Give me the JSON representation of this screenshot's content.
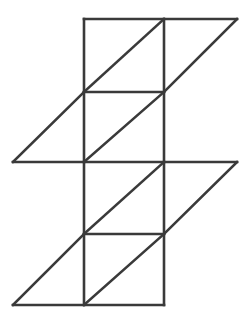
{
  "figure": {
    "background_color": "#ffffff",
    "stroke_color": "#3a3a3a",
    "stroke_width": 2.6,
    "canvas": {
      "width": 250,
      "height": 320
    },
    "grid": {
      "x_left": 84,
      "x_right": 164,
      "x_outer_left": 13,
      "x_outer_right": 237,
      "y_rows": [
        19,
        92,
        162,
        234,
        305
      ],
      "cell_width": 80,
      "cell_height": 72
    },
    "shape_counts": {
      "squares": 4,
      "triangles": 8,
      "segments": 17
    },
    "segments": [
      {
        "name": "top-edge-square-and-right-triangle",
        "x1": 84,
        "y1": 19,
        "x2": 237,
        "y2": 19
      },
      {
        "name": "row1-horizontal",
        "x1": 13,
        "y1": 162,
        "x2": 237,
        "y2": 162
      },
      {
        "name": "square1-bottom-edge",
        "x1": 84,
        "y1": 92,
        "x2": 164,
        "y2": 92
      },
      {
        "name": "square3-bottom-edge",
        "x1": 84,
        "y1": 234,
        "x2": 164,
        "y2": 234
      },
      {
        "name": "bottom-edge",
        "x1": 13,
        "y1": 305,
        "x2": 164,
        "y2": 305
      },
      {
        "name": "left-vertical-upper",
        "x1": 84,
        "y1": 19,
        "x2": 84,
        "y2": 162
      },
      {
        "name": "left-vertical-lower",
        "x1": 84,
        "y1": 162,
        "x2": 84,
        "y2": 305
      },
      {
        "name": "right-vertical-upper",
        "x1": 164,
        "y1": 19,
        "x2": 164,
        "y2": 162
      },
      {
        "name": "right-vertical-lower",
        "x1": 164,
        "y1": 162,
        "x2": 164,
        "y2": 305
      },
      {
        "name": "square1-diagonal",
        "x1": 84,
        "y1": 92,
        "x2": 164,
        "y2": 19
      },
      {
        "name": "square2-diagonal",
        "x1": 84,
        "y1": 162,
        "x2": 164,
        "y2": 92
      },
      {
        "name": "square3-diagonal",
        "x1": 84,
        "y1": 234,
        "x2": 164,
        "y2": 162
      },
      {
        "name": "square4-diagonal",
        "x1": 84,
        "y1": 305,
        "x2": 164,
        "y2": 234
      },
      {
        "name": "upper-right-triangle-hypotenuse",
        "x1": 237,
        "y1": 19,
        "x2": 164,
        "y2": 92
      },
      {
        "name": "upper-left-triangle-hypotenuse",
        "x1": 13,
        "y1": 162,
        "x2": 84,
        "y2": 92
      },
      {
        "name": "lower-right-triangle-hypotenuse",
        "x1": 237,
        "y1": 162,
        "x2": 164,
        "y2": 234
      },
      {
        "name": "lower-left-triangle-hypotenuse",
        "x1": 13,
        "y1": 305,
        "x2": 84,
        "y2": 234
      }
    ]
  }
}
